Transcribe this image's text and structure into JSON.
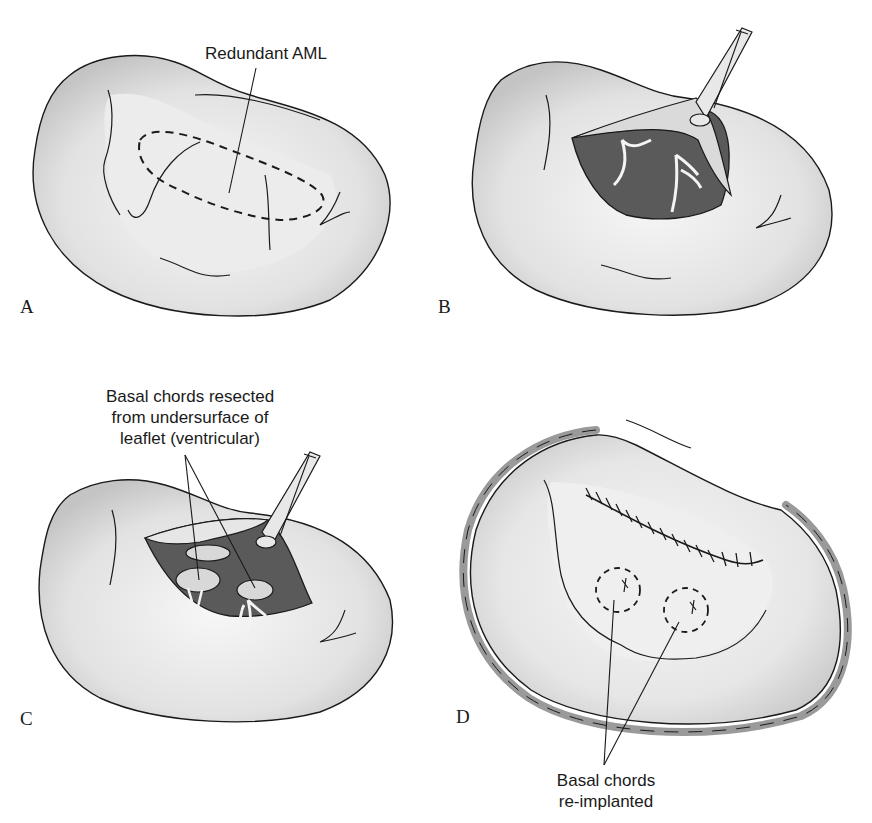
{
  "figure": {
    "colors": {
      "tissue_light": "#f4f4f4",
      "tissue_shade": "#cfcfcf",
      "cavity_dark": "#5a5a5a",
      "outline": "#1a1a1a",
      "ring": "#9a9a9a"
    },
    "panels": [
      {
        "id": "A",
        "letter": "A",
        "annotation": "Redundant AML"
      },
      {
        "id": "B",
        "letter": "B"
      },
      {
        "id": "C",
        "letter": "C",
        "annotation_lines": [
          "Basal chords resected",
          "from undersurface of",
          "leaflet (ventricular)"
        ]
      },
      {
        "id": "D",
        "letter": "D",
        "annotation_lines": [
          "Basal chords",
          "re-implanted"
        ]
      }
    ]
  }
}
